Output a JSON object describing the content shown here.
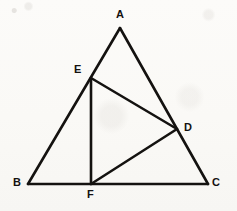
{
  "figure": {
    "type": "geometry-diagram",
    "canvas": {
      "width": 237,
      "height": 211
    },
    "background_color": "#fbfaf8",
    "stroke_color": "#141210",
    "stroke_width": 2.6,
    "label_color": "#14110f",
    "points": [
      {
        "id": "A",
        "label": "A",
        "x": 120,
        "y": 28,
        "label_x": 116,
        "label_y": 9,
        "role": "apex-vertex"
      },
      {
        "id": "B",
        "label": "B",
        "x": 28,
        "y": 184,
        "label_x": 13,
        "label_y": 177,
        "role": "base-left-vertex"
      },
      {
        "id": "C",
        "label": "C",
        "x": 208,
        "y": 184,
        "label_x": 212,
        "label_y": 177,
        "role": "base-right-vertex"
      },
      {
        "id": "D",
        "label": "D",
        "x": 177,
        "y": 129,
        "label_x": 184,
        "label_y": 122,
        "role": "point-on-AC"
      },
      {
        "id": "E",
        "label": "E",
        "x": 91,
        "y": 78,
        "label_x": 74,
        "label_y": 64,
        "role": "point-on-AB"
      },
      {
        "id": "F",
        "label": "F",
        "x": 91,
        "y": 184,
        "label_x": 87,
        "label_y": 189,
        "role": "point-on-BC"
      }
    ],
    "segments": [
      {
        "id": "AB",
        "from": "A",
        "to": "B",
        "description": "left side of triangle through E"
      },
      {
        "id": "AC",
        "from": "A",
        "to": "C",
        "description": "right side of triangle through D"
      },
      {
        "id": "BC",
        "from": "B",
        "to": "C",
        "description": "base of triangle through F"
      },
      {
        "id": "EF",
        "from": "E",
        "to": "F",
        "description": "vertical segment from E to F"
      },
      {
        "id": "ED",
        "from": "E",
        "to": "D",
        "description": "segment from E to D"
      },
      {
        "id": "FD",
        "from": "F",
        "to": "D",
        "description": "segment from F to D"
      }
    ]
  }
}
